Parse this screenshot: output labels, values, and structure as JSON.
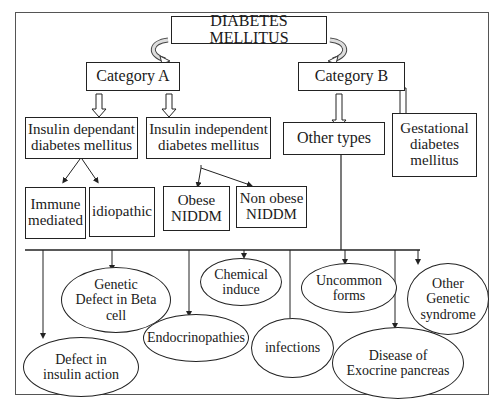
{
  "diagram": {
    "root": {
      "label": "DIABETES MELLITUS"
    },
    "categories": [
      {
        "label": "Category A"
      },
      {
        "label": "Category B"
      }
    ],
    "category_a_children": [
      {
        "label": "Insulin dependant\ndiabetes mellitus"
      },
      {
        "label": "Insulin independent\ndiabetes mellitus"
      }
    ],
    "category_b_children": [
      {
        "label": "Other types"
      },
      {
        "label": "Gestational\ndiabetes\nmellitus"
      }
    ],
    "iddm_subtypes": [
      {
        "label": "Immune\nmediated"
      },
      {
        "label": "idiopathic"
      }
    ],
    "niddm_subtypes": [
      {
        "label": "Obese\nNIDDM"
      },
      {
        "label": "Non obese\nNIDDM"
      }
    ],
    "other_types": [
      {
        "label": "Genetic\nDefect in Beta\ncell"
      },
      {
        "label": "Defect in\ninsulin action"
      },
      {
        "label": "Endocrinopathies"
      },
      {
        "label": "Chemical\ninduce"
      },
      {
        "label": "infections"
      },
      {
        "label": "Uncommon\nforms"
      },
      {
        "label": "Disease of\nExocrine pancreas"
      },
      {
        "label": "Other\nGenetic\nsyndrome"
      }
    ]
  },
  "colors": {
    "line": "#222222",
    "frame": "#555555",
    "background": "#ffffff"
  }
}
